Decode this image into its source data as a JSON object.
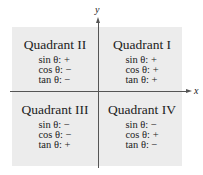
{
  "axes": {
    "x_label": "x",
    "y_label": "y"
  },
  "quadrants": {
    "q2": {
      "title": "Quadrant II",
      "sin": "sin θ: +",
      "cos": "cos θ: −",
      "tan": "tan θ: −"
    },
    "q1": {
      "title": "Quadrant I",
      "sin": "sin θ: +",
      "cos": "cos θ: +",
      "tan": "tan θ: +"
    },
    "q3": {
      "title": "Quadrant III",
      "sin": "sin θ: −",
      "cos": "cos θ: −",
      "tan": "tan θ: +"
    },
    "q4": {
      "title": "Quadrant IV",
      "sin": "sin θ: −",
      "cos": "cos θ: +",
      "tan": "tan θ: −"
    }
  },
  "colors": {
    "background": "#ececec",
    "axis": "#555555"
  }
}
